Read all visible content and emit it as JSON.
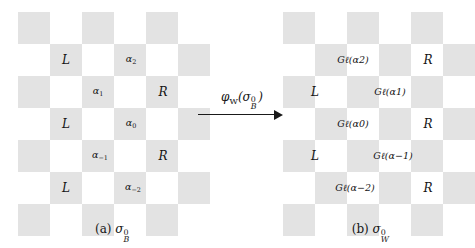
{
  "figure": {
    "type": "checkerboard-diagram",
    "colors": {
      "gray_cell": "#e3e3e3",
      "white_cell": "#ffffff",
      "text": "#141414"
    },
    "grid": {
      "columns": 6,
      "rows": 7,
      "cell_px": 32
    }
  },
  "left_panel": {
    "name": "sigma-B-0",
    "caption_prefix": "(a)",
    "caption_symbol": "σ",
    "caption_sub": "B",
    "caption_sup": "0",
    "cells": [
      {
        "row": 1,
        "col": 1,
        "label": "L",
        "kind": "plain"
      },
      {
        "row": 1,
        "col": 3,
        "label": "α",
        "sub": "2",
        "kind": "alpha"
      },
      {
        "row": 2,
        "col": 2,
        "label": "α",
        "sub": "1",
        "kind": "alpha"
      },
      {
        "row": 2,
        "col": 4,
        "label": "R",
        "kind": "plain"
      },
      {
        "row": 3,
        "col": 1,
        "label": "L",
        "kind": "plain"
      },
      {
        "row": 3,
        "col": 3,
        "label": "α",
        "sub": "0",
        "kind": "alpha"
      },
      {
        "row": 4,
        "col": 2,
        "label": "α",
        "sub": "−1",
        "kind": "alpha"
      },
      {
        "row": 4,
        "col": 4,
        "label": "R",
        "kind": "plain"
      },
      {
        "row": 5,
        "col": 1,
        "label": "L",
        "kind": "plain"
      },
      {
        "row": 5,
        "col": 3,
        "label": "α",
        "sub": "−2",
        "kind": "alpha"
      }
    ],
    "labels_flat": [
      "L",
      "α2",
      "α1",
      "R",
      "L",
      "α0",
      "α−1",
      "R",
      "L",
      "α−2"
    ]
  },
  "right_panel": {
    "name": "sigma-W-0",
    "caption_prefix": "(b)",
    "caption_symbol": "σ",
    "caption_sub": "W",
    "caption_sup": "0",
    "cells": [
      {
        "row": 1,
        "col": 3,
        "label": "Gℓ(α2)",
        "kind": "gmap"
      },
      {
        "row": 1,
        "col": 5,
        "label": "R",
        "kind": "plain"
      },
      {
        "row": 2,
        "col": 2,
        "label": "L",
        "kind": "plain"
      },
      {
        "row": 2,
        "col": 4,
        "label": "Gℓ(α1)",
        "kind": "gmap"
      },
      {
        "row": 3,
        "col": 3,
        "label": "Gℓ(α0)",
        "kind": "gmap"
      },
      {
        "row": 3,
        "col": 5,
        "label": "R",
        "kind": "plain"
      },
      {
        "row": 4,
        "col": 2,
        "label": "L",
        "kind": "plain"
      },
      {
        "row": 4,
        "col": 4,
        "label": "Gℓ(α−1)",
        "kind": "gmap"
      },
      {
        "row": 5,
        "col": 3,
        "label": "Gℓ(α−2)",
        "kind": "gmap"
      },
      {
        "row": 5,
        "col": 5,
        "label": "R",
        "kind": "plain"
      }
    ],
    "labels_flat": [
      "Gℓ(α2)",
      "R",
      "L",
      "Gℓ(α1)",
      "Gℓ(α0)",
      "R",
      "L",
      "Gℓ(α−1)",
      "Gℓ(α−2)",
      "R"
    ]
  },
  "arrow": {
    "label_phi": "φ",
    "label_sub": "W",
    "label_open": "(",
    "label_sigma": "σ",
    "label_sigma_sub": "B",
    "label_sigma_sup": "0",
    "label_close": ")",
    "label_text": "φW(σB0)",
    "direction": "left-to-right"
  }
}
